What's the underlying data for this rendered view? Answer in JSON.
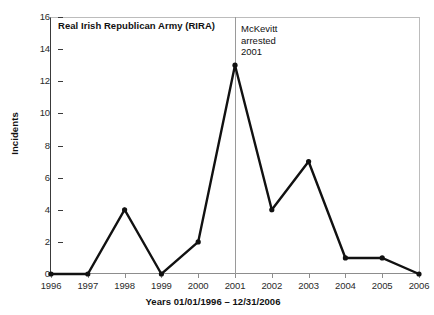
{
  "chart_data": {
    "type": "line",
    "title": "Real Irish Republican Army (RIRA)",
    "xlabel": "Years 01/01/1996 – 12/31/2006",
    "ylabel": "Incidents",
    "categories": [
      "1996",
      "1997",
      "1998",
      "1999",
      "2000",
      "2001",
      "2002",
      "2003",
      "2004",
      "2005",
      "2006"
    ],
    "values": [
      0,
      0,
      4,
      0,
      2,
      13,
      4,
      7,
      1,
      1,
      0
    ],
    "x": [
      1996,
      1997,
      1998,
      1999,
      2000,
      2001,
      2002,
      2003,
      2004,
      2005,
      2006
    ],
    "ylim": [
      0,
      16
    ],
    "xlim": [
      1996,
      2006
    ],
    "y_ticks": [
      0,
      2,
      4,
      6,
      8,
      10,
      12,
      14,
      16
    ],
    "y_tick_labels": [
      "0",
      "2",
      "4",
      "6",
      "8",
      "10",
      "12",
      "14",
      "16"
    ],
    "grid": false,
    "legend": false,
    "series_color": "#111111",
    "annotations": [
      {
        "name": "mckevitt-arrest",
        "line1": "McKevitt",
        "line2": "arrested",
        "line3": "2001",
        "at_x": 2001,
        "line_color": "#9a9a9a"
      }
    ]
  },
  "colors": {
    "series": "#111111",
    "axis": "#3a3a3a",
    "frame": "#bcbcbc",
    "annotation_line": "#9a9a9a",
    "background": "#ffffff"
  }
}
